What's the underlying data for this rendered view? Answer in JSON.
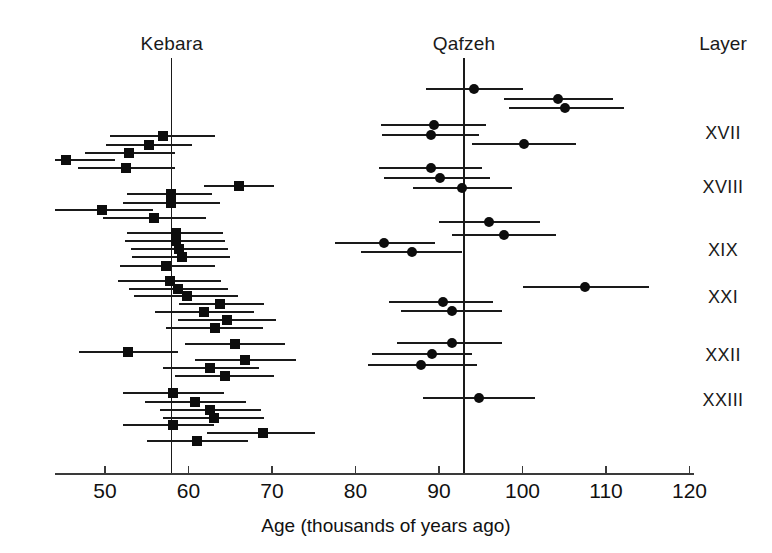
{
  "figure": {
    "width": 772,
    "height": 553,
    "background": "#ffffff",
    "ink_color": "#111111"
  },
  "headers": {
    "kebara": "Kebara",
    "qafzeh": "Qafzeh",
    "layer": "Layer"
  },
  "layer_labels": [
    {
      "text": "XVII",
      "y": 133
    },
    {
      "text": "XVIII",
      "y": 187
    },
    {
      "text": "XIX",
      "y": 250
    },
    {
      "text": "XXI",
      "y": 297
    },
    {
      "text": "XXII",
      "y": 355
    },
    {
      "text": "XXIII",
      "y": 400
    }
  ],
  "chart_data": {
    "type": "scatter",
    "title": "",
    "subtitle": "",
    "xlabel": "Age (thousands of years ago)",
    "ylabel": "",
    "xlim": [
      44,
      122
    ],
    "ylim": [
      0,
      1
    ],
    "grid": false,
    "legend_position": "none",
    "x_ticks": [
      50,
      60,
      70,
      80,
      90,
      100,
      110,
      120
    ],
    "x_tick_labels": [
      "50",
      "60",
      "70",
      "80",
      "90",
      "100",
      "110",
      "120"
    ],
    "axis_left_value": 44.0,
    "axis_right_value": 120.5,
    "reference_lines": [
      {
        "name": "Kebara",
        "value": 58,
        "label": "Kebara"
      },
      {
        "name": "Qafzeh",
        "value": 93,
        "label": "Qafzeh"
      }
    ],
    "series": [
      {
        "name": "Kebara",
        "marker": "square",
        "color": "#0d0d0d",
        "label": "Kebara",
        "points": [
          {
            "row": 1,
            "y": 136,
            "value": 56.9,
            "low": 50.6,
            "high": 63.2
          },
          {
            "row": 2,
            "y": 145,
            "value": 55.3,
            "low": 50.1,
            "high": 60.4
          },
          {
            "row": 3,
            "y": 153,
            "value": 52.9,
            "low": 47.6,
            "high": 58.4
          },
          {
            "row": 4,
            "y": 160,
            "value": 45.3,
            "low": 44.0,
            "high": 51.2
          },
          {
            "row": 5,
            "y": 168,
            "value": 52.5,
            "low": 46.8,
            "high": 58.4
          },
          {
            "row": 6,
            "y": 186,
            "value": 66.1,
            "low": 61.9,
            "high": 70.3
          },
          {
            "row": 7,
            "y": 194,
            "value": 57.9,
            "low": 52.6,
            "high": 62.8
          },
          {
            "row": 8,
            "y": 203,
            "value": 57.9,
            "low": 52.1,
            "high": 63.8
          },
          {
            "row": 9,
            "y": 210,
            "value": 49.6,
            "low": 44.0,
            "high": 55.7
          },
          {
            "row": 10,
            "y": 218,
            "value": 55.9,
            "low": 49.8,
            "high": 62.1
          },
          {
            "row": 11,
            "y": 233,
            "value": 58.5,
            "low": 52.6,
            "high": 64.1
          },
          {
            "row": 12,
            "y": 241,
            "value": 58.5,
            "low": 52.4,
            "high": 64.4
          },
          {
            "row": 13,
            "y": 249,
            "value": 58.9,
            "low": 53.1,
            "high": 64.7
          },
          {
            "row": 14,
            "y": 257,
            "value": 59.2,
            "low": 53.2,
            "high": 65.0
          },
          {
            "row": 15,
            "y": 266,
            "value": 57.3,
            "low": 51.8,
            "high": 63.2
          },
          {
            "row": 16,
            "y": 281,
            "value": 57.8,
            "low": 51.6,
            "high": 63.9
          },
          {
            "row": 17,
            "y": 289,
            "value": 58.8,
            "low": 52.9,
            "high": 64.7
          },
          {
            "row": 18,
            "y": 296,
            "value": 59.8,
            "low": 53.5,
            "high": 65.9
          },
          {
            "row": 19,
            "y": 304,
            "value": 63.8,
            "low": 58.9,
            "high": 69.1
          },
          {
            "row": 20,
            "y": 312,
            "value": 61.9,
            "low": 56.0,
            "high": 67.9
          },
          {
            "row": 21,
            "y": 320,
            "value": 64.6,
            "low": 58.7,
            "high": 70.5
          },
          {
            "row": 22,
            "y": 328,
            "value": 63.2,
            "low": 57.3,
            "high": 68.9
          },
          {
            "row": 23,
            "y": 344,
            "value": 65.6,
            "low": 59.6,
            "high": 71.5
          },
          {
            "row": 24,
            "y": 352,
            "value": 52.8,
            "low": 46.9,
            "high": 58.7
          },
          {
            "row": 25,
            "y": 360,
            "value": 66.8,
            "low": 60.8,
            "high": 72.9
          },
          {
            "row": 26,
            "y": 368,
            "value": 62.6,
            "low": 56.9,
            "high": 68.5
          },
          {
            "row": 27,
            "y": 376,
            "value": 64.4,
            "low": 58.4,
            "high": 70.2
          },
          {
            "row": 28,
            "y": 393,
            "value": 58.2,
            "low": 52.1,
            "high": 64.2
          },
          {
            "row": 29,
            "y": 402,
            "value": 60.8,
            "low": 54.8,
            "high": 66.9
          },
          {
            "row": 30,
            "y": 410,
            "value": 62.6,
            "low": 56.6,
            "high": 68.7
          },
          {
            "row": 31,
            "y": 418,
            "value": 63.0,
            "low": 57.0,
            "high": 69.1
          },
          {
            "row": 32,
            "y": 425,
            "value": 58.2,
            "low": 52.2,
            "high": 63.1
          },
          {
            "row": 33,
            "y": 433,
            "value": 68.9,
            "low": 62.2,
            "high": 75.1
          },
          {
            "row": 34,
            "y": 441,
            "value": 61.0,
            "low": 55.0,
            "high": 67.1
          }
        ]
      },
      {
        "name": "Qafzeh",
        "marker": "circle",
        "color": "#0d0d0d",
        "label": "Qafzeh",
        "points": [
          {
            "row": 1,
            "y": 89,
            "value": 94.2,
            "low": 88.5,
            "high": 100.1
          },
          {
            "row": 2,
            "y": 99,
            "value": 104.2,
            "low": 97.8,
            "high": 110.8
          },
          {
            "row": 3,
            "y": 108,
            "value": 105.1,
            "low": 98.4,
            "high": 112.1
          },
          {
            "row": 4,
            "y": 125,
            "value": 89.4,
            "low": 83.1,
            "high": 95.6
          },
          {
            "row": 5,
            "y": 135,
            "value": 89.1,
            "low": 83.2,
            "high": 94.8
          },
          {
            "row": 6,
            "y": 144,
            "value": 100.2,
            "low": 94.0,
            "high": 106.4
          },
          {
            "row": 7,
            "y": 168,
            "value": 89.0,
            "low": 82.8,
            "high": 95.1
          },
          {
            "row": 8,
            "y": 178,
            "value": 90.1,
            "low": 83.4,
            "high": 96.1
          },
          {
            "row": 9,
            "y": 188,
            "value": 92.8,
            "low": 86.9,
            "high": 98.8
          },
          {
            "row": 10,
            "y": 222,
            "value": 96.0,
            "low": 90.0,
            "high": 102.1
          },
          {
            "row": 11,
            "y": 235,
            "value": 97.8,
            "low": 91.5,
            "high": 104.0
          },
          {
            "row": 12,
            "y": 243,
            "value": 83.4,
            "low": 77.5,
            "high": 89.5
          },
          {
            "row": 13,
            "y": 252,
            "value": 86.8,
            "low": 80.6,
            "high": 92.8
          },
          {
            "row": 14,
            "y": 287,
            "value": 107.5,
            "low": 100.1,
            "high": 115.2
          },
          {
            "row": 15,
            "y": 302,
            "value": 90.5,
            "low": 84.0,
            "high": 96.5
          },
          {
            "row": 16,
            "y": 311,
            "value": 91.6,
            "low": 85.5,
            "high": 97.6
          },
          {
            "row": 17,
            "y": 343,
            "value": 91.6,
            "low": 85.0,
            "high": 97.5
          },
          {
            "row": 18,
            "y": 354,
            "value": 89.2,
            "low": 82.0,
            "high": 94.0
          },
          {
            "row": 19,
            "y": 365,
            "value": 87.9,
            "low": 81.5,
            "high": 94.5
          },
          {
            "row": 20,
            "y": 398,
            "value": 94.8,
            "low": 88.1,
            "high": 101.5
          }
        ]
      }
    ]
  }
}
